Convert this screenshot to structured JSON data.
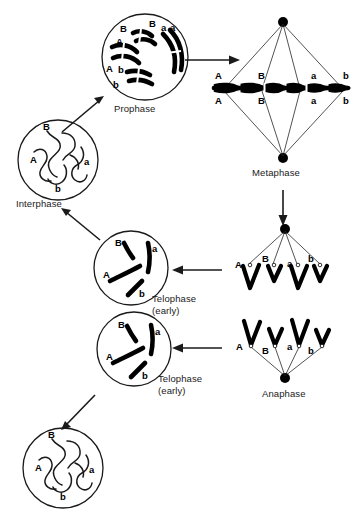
{
  "diagram": {
    "colors": {
      "ink": "#1a1a1a",
      "chromosome": "#000000",
      "background": "#ffffff"
    },
    "stages": [
      {
        "id": "interphase",
        "caption": "Interphase",
        "sub_caption": "",
        "alleles": [
          "B",
          "A",
          "b",
          "a"
        ],
        "form": "thin chromatin threads in nucleus"
      },
      {
        "id": "prophase",
        "caption": "Prophase",
        "sub_caption": "",
        "alleles": [
          "B",
          "B",
          "a",
          "a",
          "A",
          "A",
          "b",
          "b"
        ],
        "form": "condensed duplicated chromosomes in nucleus"
      },
      {
        "id": "metaphase",
        "caption": "Metaphase",
        "sub_caption": "",
        "alleles_top": [
          "A",
          "B",
          "a",
          "b"
        ],
        "alleles_bottom": [
          "A",
          "B",
          "a",
          "b"
        ],
        "form": "chromosomes aligned on spindle equator"
      },
      {
        "id": "anaphase",
        "caption": "Anaphase",
        "sub_caption": "",
        "alleles": [
          "A",
          "B",
          "a",
          "b"
        ],
        "form": "V-shaped chromatids migrating to pole"
      },
      {
        "id": "anaphase-upper",
        "caption": "",
        "sub_caption": "",
        "alleles": [
          "A",
          "B",
          "a",
          "b"
        ],
        "form": "V-shaped chromatids migrating to opposite pole"
      },
      {
        "id": "telophase-upper",
        "caption": "Telophase",
        "sub_caption": "(early)",
        "alleles": [
          "B",
          "a",
          "A",
          "b"
        ],
        "form": "separated chromosomes in reforming nucleus"
      },
      {
        "id": "telophase-lower",
        "caption": "Telophase",
        "sub_caption": "(early)",
        "alleles": [
          "B",
          "a",
          "A",
          "b"
        ],
        "form": "separated chromosomes in reforming nucleus"
      },
      {
        "id": "daughter-cell",
        "caption": "",
        "sub_caption": "",
        "alleles": [
          "B",
          "A",
          "b",
          "a"
        ],
        "form": "thin chromatin threads in daughter nucleus"
      }
    ]
  }
}
